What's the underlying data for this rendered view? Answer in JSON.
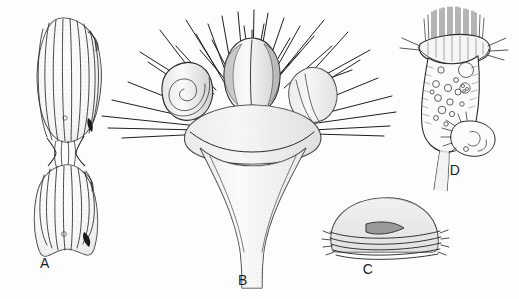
{
  "figure": {
    "background_color": "#fdfdfd",
    "ink_color": "#2b2b2b",
    "width": 519,
    "height": 299,
    "medium": "pen-and-ink stipple scientific illustration",
    "panel_count": 4
  },
  "panels": [
    {
      "label": "A",
      "name": "panel-a",
      "subject": "dumbbell-shaped ribbed cell with two lobes joined at a constricted waist",
      "label_x": 45,
      "label_y": 268,
      "features": {
        "rib_count": 10,
        "lobes": 2,
        "notch": "upper-right shoulder indentation on each lobe",
        "dark_marks": 2
      }
    },
    {
      "label": "B",
      "name": "panel-b",
      "subject": "trumpet-shaped body with three crowned lobes and radiating spines",
      "label_x": 243,
      "label_y": 285,
      "features": {
        "lobes": 3,
        "left_lobe_pattern": "concentric spiral whorl",
        "centre_lobe_pattern": "cleft with shaded flanks",
        "right_lobe_pattern": "smooth shaded ovoid",
        "spine_count": 38,
        "stalk": "flaring funnel stalk"
      }
    },
    {
      "label": "C",
      "name": "panel-c",
      "subject": "dome-shaped body with banded base and dark triangular marking",
      "label_x": 368,
      "label_y": 272,
      "features": {
        "bands": 5,
        "marking": "dark shaded triangle near apex-centre"
      }
    },
    {
      "label": "D",
      "name": "panel-d",
      "subject": "stalked ciliate with ciliary crown, vacuolated body and attached smaller ciliate",
      "label_x": 455,
      "label_y": 175,
      "features": {
        "cilia": "dense vertical ciliary tuft over curved peristome",
        "vacuoles": 14,
        "large_vacuole": 1,
        "stalk": "narrow twin-walled stalk",
        "epibiont": "small ovoid ciliate attached at lower right"
      }
    }
  ],
  "labels": {
    "a": "A",
    "b": "B",
    "c": "C",
    "d": "D"
  }
}
